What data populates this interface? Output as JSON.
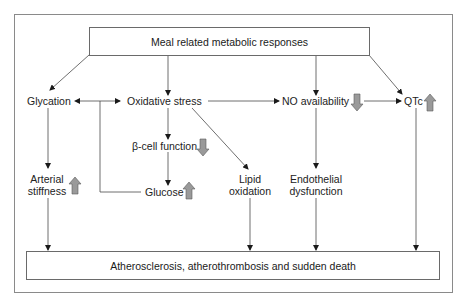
{
  "diagram": {
    "top_box": "Meal related metabolic responses",
    "bottom_box": "Atherosclerosis, atherothrombosis and sudden death",
    "nodes": {
      "glycation": "Glycation",
      "oxidative_stress": "Oxidative stress",
      "no_availability": "NO availability",
      "qtc": "QTc",
      "beta_cell_function": "β-cell function",
      "glucose": "Glucose",
      "lipid_oxidation_1": "Lipid",
      "lipid_oxidation_2": "oxidation",
      "endothelial_1": "Endothelial",
      "endothelial_2": "dysfunction",
      "arterial_1": "Arterial",
      "arterial_2": "stiffness"
    },
    "indicators": {
      "no_availability": "down-arrow",
      "qtc": "up-arrow",
      "beta_cell_function": "down-arrow",
      "glucose": "up-arrow",
      "arterial_stiffness": "up-arrow"
    },
    "colors": {
      "line": "#4a4a4a",
      "indicator_fill": "#9a9a9a",
      "indicator_stroke": "#5a5a5a",
      "frame": "#8a8a8a"
    }
  }
}
